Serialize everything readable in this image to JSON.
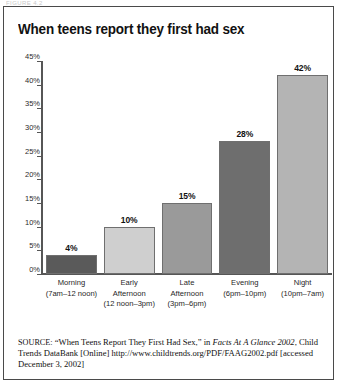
{
  "top_stub_text": "FIGURE 4.2",
  "figure": {
    "title": "When teens report they first had sex"
  },
  "chart_data": {
    "type": "bar",
    "title": "When teens report they first had sex",
    "xlabel": "",
    "ylabel": "",
    "ylim": [
      0,
      45
    ],
    "grid": false,
    "legend": "none",
    "categories": [
      "Morning",
      "Early Afternoon",
      "Late Afternoon",
      "Evening",
      "Night"
    ],
    "category_lines": [
      [
        "Morning",
        "(7am–12 noon)"
      ],
      [
        "Early",
        "Afternoon",
        "(12 noon–3pm)"
      ],
      [
        "Late",
        "Afternoon",
        "(3pm–6pm)"
      ],
      [
        "Evening",
        "(6pm–10pm)"
      ],
      [
        "Night",
        "(10pm–7am)"
      ]
    ],
    "values": [
      4,
      10,
      15,
      28,
      42
    ],
    "value_labels": [
      "4%",
      "10%",
      "15%",
      "28%",
      "42%"
    ],
    "bar_colors": [
      "#5a5a5a",
      "#cfcfcf",
      "#9a9a9a",
      "#6e6e6e",
      "#b4b4b4"
    ],
    "ytick_labels": [
      "45%",
      "40%",
      "35%",
      "30%",
      "25%",
      "20%",
      "15%",
      "10%",
      "5%",
      "0%"
    ],
    "ytick_values": [
      45,
      40,
      35,
      30,
      25,
      20,
      15,
      10,
      5,
      0
    ]
  },
  "source": {
    "label": "SOURCE:",
    "part1": " “When Teens Report They First Had Sex,” in ",
    "italic1": "Facts At A Glance 2002",
    "part2": ", Child Trends DataBank [Online] http://www.childtrends.org/PDF/FAAG2002.pdf [accessed December 3, 2002]"
  }
}
